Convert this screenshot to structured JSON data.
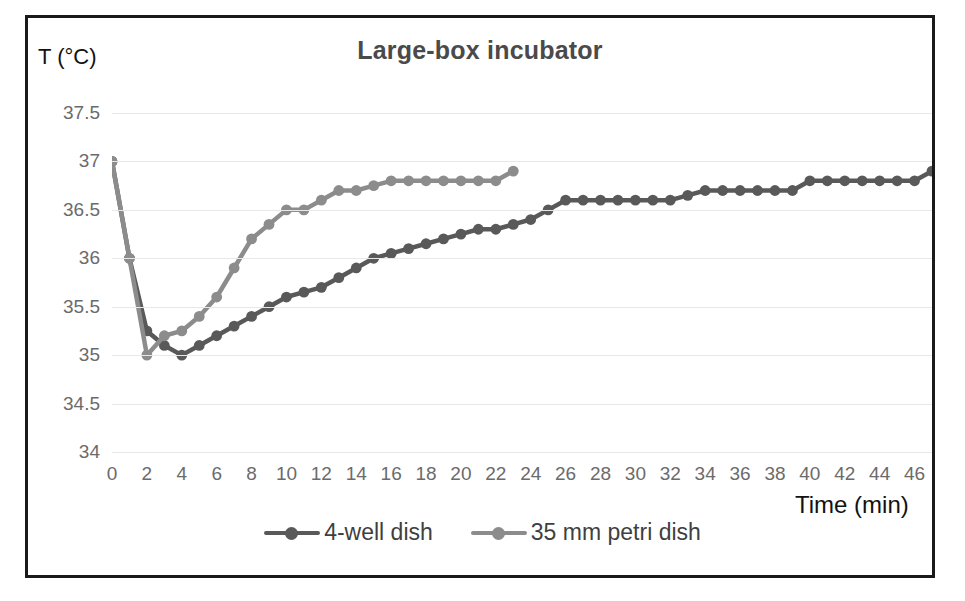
{
  "chart_data": {
    "type": "line",
    "title": "Large-box incubator",
    "xlabel": "Time (min)",
    "ylabel": "T (°C)",
    "xlim": [
      0,
      47
    ],
    "ylim": [
      34,
      37.5
    ],
    "grid": true,
    "legend_position": "bottom",
    "xticks": [
      0,
      2,
      4,
      6,
      8,
      10,
      12,
      14,
      16,
      18,
      20,
      22,
      24,
      26,
      28,
      30,
      32,
      34,
      36,
      38,
      40,
      42,
      44,
      46
    ],
    "yticks": [
      "37.5",
      "37",
      "36.5",
      "36",
      "35.5",
      "35",
      "34.5",
      "34"
    ],
    "series": [
      {
        "name": "4-well dish",
        "color": "#595959",
        "x": [
          0,
          1,
          2,
          3,
          4,
          5,
          6,
          7,
          8,
          9,
          10,
          11,
          12,
          13,
          14,
          15,
          16,
          17,
          18,
          19,
          20,
          21,
          22,
          23,
          24,
          25,
          26,
          27,
          28,
          29,
          30,
          31,
          32,
          33,
          34,
          35,
          36,
          37,
          38,
          39,
          40,
          41,
          42,
          43,
          44,
          45,
          46,
          47
        ],
        "values": [
          37,
          36,
          35.25,
          35.1,
          35,
          35.1,
          35.2,
          35.3,
          35.4,
          35.5,
          35.6,
          35.65,
          35.7,
          35.8,
          35.9,
          36,
          36.05,
          36.1,
          36.15,
          36.2,
          36.25,
          36.3,
          36.3,
          36.35,
          36.4,
          36.5,
          36.6,
          36.6,
          36.6,
          36.6,
          36.6,
          36.6,
          36.6,
          36.65,
          36.7,
          36.7,
          36.7,
          36.7,
          36.7,
          36.7,
          36.8,
          36.8,
          36.8,
          36.8,
          36.8,
          36.8,
          36.8,
          36.9
        ]
      },
      {
        "name": "35 mm petri dish",
        "color": "#8c8c8c",
        "x": [
          0,
          1,
          2,
          3,
          4,
          5,
          6,
          7,
          8,
          9,
          10,
          11,
          12,
          13,
          14,
          15,
          16,
          17,
          18,
          19,
          20,
          21,
          22,
          23
        ],
        "values": [
          37,
          36,
          35,
          35.2,
          35.25,
          35.4,
          35.6,
          35.9,
          36.2,
          36.35,
          36.5,
          36.5,
          36.6,
          36.7,
          36.7,
          36.75,
          36.8,
          36.8,
          36.8,
          36.8,
          36.8,
          36.8,
          36.8,
          36.9
        ]
      }
    ]
  },
  "legend": {
    "entries": [
      {
        "label": "4-well dish",
        "color": "#595959"
      },
      {
        "label": "35 mm petri dish",
        "color": "#8c8c8c"
      }
    ]
  }
}
